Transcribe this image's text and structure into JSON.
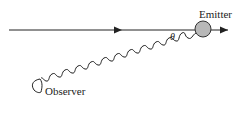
{
  "labels": {
    "emitter": "Emitter",
    "observer": "Observer",
    "angle": "θ"
  },
  "colors": {
    "line": "#222222",
    "emitter_fill": "#b8b8b8",
    "background": "#ffffff"
  }
}
